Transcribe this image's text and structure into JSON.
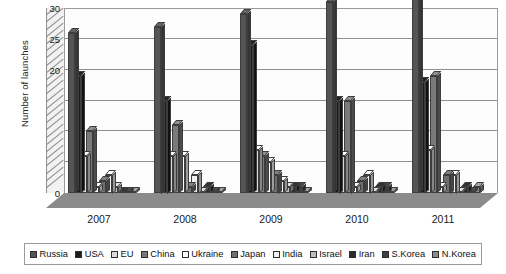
{
  "chart_data": {
    "type": "bar",
    "title": "",
    "xlabel": "",
    "ylabel": "Number of launches",
    "categories": [
      "2007",
      "2008",
      "2009",
      "2010",
      "2011"
    ],
    "ylim": [
      0,
      30
    ],
    "yticks": [
      "0",
      "20",
      "25",
      "30"
    ],
    "ytick_values": [
      0,
      20,
      25,
      30
    ],
    "grid": true,
    "legend_position": "bottom",
    "style": "3d-grouped-bar-grayscale",
    "series": [
      {
        "name": "Russia",
        "color": "#555555",
        "values": [
          26,
          27,
          29,
          31,
          32
        ]
      },
      {
        "name": "USA",
        "color": "#1c1c1c",
        "values": [
          19,
          15,
          24,
          15,
          18
        ]
      },
      {
        "name": "EU",
        "color": "#d9d9d9",
        "values": [
          6,
          6,
          7,
          6,
          7
        ]
      },
      {
        "name": "China",
        "color": "#7a7a7a",
        "values": [
          10,
          11,
          6,
          15,
          19
        ]
      },
      {
        "name": "Ukraine",
        "color": "#ffffff",
        "values": [
          1,
          6,
          5,
          1,
          1
        ]
      },
      {
        "name": "Japan",
        "color": "#6e6e6e",
        "values": [
          2,
          1,
          3,
          2,
          3
        ]
      },
      {
        "name": "India",
        "color": "#f0f0f0",
        "values": [
          3,
          3,
          2,
          3,
          3
        ]
      },
      {
        "name": "Israel",
        "color": "#bdbdbd",
        "values": [
          1,
          0,
          1,
          0,
          0
        ]
      },
      {
        "name": "Iran",
        "color": "#2b2b2b",
        "values": [
          0,
          1,
          1,
          1,
          1
        ]
      },
      {
        "name": "S.Korea",
        "color": "#3f3f3f",
        "values": [
          0,
          0,
          1,
          1,
          0
        ]
      },
      {
        "name": "N.Korea",
        "color": "#8a8a8a",
        "values": [
          0,
          0,
          0,
          0,
          1
        ]
      }
    ]
  },
  "axes": {
    "y_title": "Number of launches"
  },
  "legend": {
    "items": [
      {
        "label": "Russia"
      },
      {
        "label": "USA"
      },
      {
        "label": "EU"
      },
      {
        "label": "China"
      },
      {
        "label": "Ukraine"
      },
      {
        "label": "Japan"
      },
      {
        "label": "India"
      },
      {
        "label": "Israel"
      },
      {
        "label": "Iran"
      },
      {
        "label": "S.Korea"
      },
      {
        "label": "N.Korea"
      }
    ]
  }
}
